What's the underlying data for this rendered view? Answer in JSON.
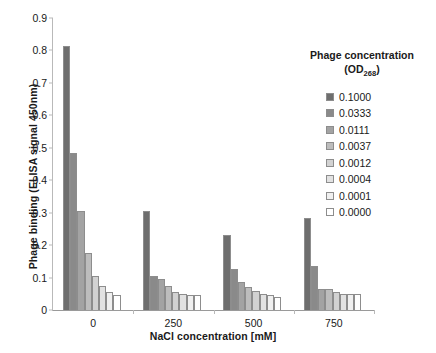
{
  "chart_data": {
    "type": "bar",
    "title": "",
    "subtitle": "",
    "xlabel": "NaCl concentration [mM]",
    "ylabel": "Phage binding (ELISA signal 450nm)",
    "categories": [
      "0",
      "250",
      "500",
      "750"
    ],
    "xtick_labels": [
      "0",
      "250",
      "500",
      "750"
    ],
    "ytick_labels": [
      "0",
      "0.1",
      "0.2",
      "0.3",
      "0.4",
      "0.5",
      "0.6",
      "0.7",
      "0.8",
      "0.9"
    ],
    "ylim": [
      0,
      0.9
    ],
    "ytick_step": 0.1,
    "grid": false,
    "legend_position": "right",
    "legend_title_line1": "Phage concentration",
    "legend_title_line2_prefix": "(OD",
    "legend_title_line2_sub": "268",
    "legend_title_line2_suffix": ")",
    "series": [
      {
        "name": "0.1000",
        "color": "#6e6e6e",
        "values": [
          0.815,
          0.305,
          0.23,
          0.285
        ]
      },
      {
        "name": "0.0333",
        "color": "#8a8a8a",
        "values": [
          0.485,
          0.105,
          0.125,
          0.135
        ]
      },
      {
        "name": "0.0111",
        "color": "#a3a3a3",
        "values": [
          0.305,
          0.095,
          0.085,
          0.065
        ]
      },
      {
        "name": "0.0037",
        "color": "#bdbdbd",
        "values": [
          0.175,
          0.075,
          0.07,
          0.065
        ]
      },
      {
        "name": "0.0012",
        "color": "#d2d2d2",
        "values": [
          0.105,
          0.055,
          0.06,
          0.055
        ]
      },
      {
        "name": "0.0004",
        "color": "#e2e2e2",
        "values": [
          0.075,
          0.05,
          0.05,
          0.05
        ]
      },
      {
        "name": "0.0001",
        "color": "#f0f0f0",
        "values": [
          0.055,
          0.045,
          0.045,
          0.05
        ]
      },
      {
        "name": "0.0000",
        "color": "#ffffff",
        "values": [
          0.045,
          0.045,
          0.04,
          0.05
        ]
      }
    ]
  }
}
